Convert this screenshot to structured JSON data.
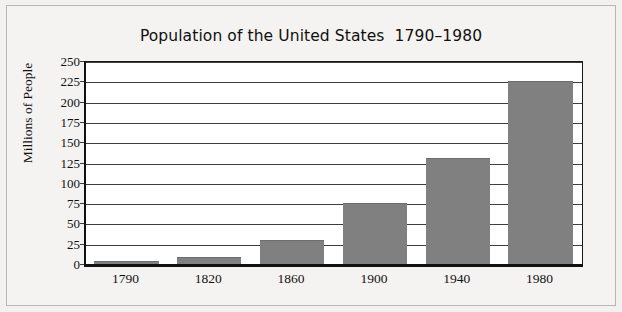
{
  "chart_data": {
    "type": "bar",
    "title": "Population of the United States  1790–1980",
    "xlabel": "",
    "ylabel": "Millions of People",
    "categories": [
      "1790",
      "1820",
      "1860",
      "1900",
      "1940",
      "1980"
    ],
    "values": [
      5,
      10,
      31,
      76,
      132,
      227
    ],
    "ylim": [
      0,
      250
    ],
    "y_ticks": [
      0,
      25,
      50,
      75,
      100,
      125,
      150,
      175,
      200,
      225,
      250
    ],
    "y_tick_labels": [
      "0",
      "25",
      "50",
      "75",
      "100",
      "125",
      "150",
      "175",
      "200",
      "225",
      "250"
    ],
    "grid": true,
    "legend": false,
    "series": [
      {
        "name": "Population",
        "values": [
          5,
          10,
          31,
          76,
          132,
          227
        ]
      }
    ],
    "colors": {
      "bar_fill": "#808080",
      "bar_edge": "#6d6d6d",
      "axis": "#111111",
      "gridline": "#3d3d3d",
      "plot_background": "#ffffff",
      "figure_background": "#f2f1ef",
      "frame": "#b9b7b4",
      "text": "#111111"
    }
  }
}
